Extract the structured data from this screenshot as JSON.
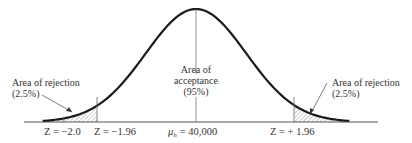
{
  "diagram": {
    "type": "normal-distribution-hypothesis-test",
    "center_label": {
      "line1": "Area of",
      "line2": "acceptance",
      "line3": "(95%)"
    },
    "left_tail_label": {
      "line1": "Area of rejection",
      "line2": "(2.5%)"
    },
    "right_tail_label": {
      "line1": "Area of rejection",
      "line2": "(2.5%)"
    },
    "axis_labels": {
      "z_neg_2": "Z = −2.0",
      "z_neg_196": "Z = −1.96",
      "mu": "= 40,000",
      "mu_symbol": "μ",
      "mu_subscript": "h",
      "z_pos_196": "Z = + 1.96"
    },
    "critical_values": [
      -1.96,
      1.96
    ],
    "sample_z": -2.0,
    "acceptance_percent": 95,
    "rejection_percent_each_tail": 2.5,
    "mean": 40000,
    "colors": {
      "curve": "#1a1a1a",
      "axis": "#555555",
      "hatch": "#777777",
      "text": "#333333"
    }
  }
}
